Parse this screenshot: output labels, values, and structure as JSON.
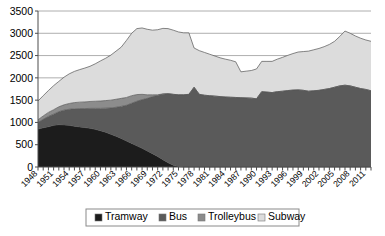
{
  "chart_data": {
    "type": "area",
    "stacked": true,
    "title": "",
    "xlabel": "",
    "ylabel": "",
    "ylim": [
      0,
      3500
    ],
    "yticks": [
      0,
      500,
      1000,
      1500,
      2000,
      2500,
      3000,
      3500
    ],
    "grid": true,
    "legend_position": "bottom",
    "x": [
      1948,
      1949,
      1950,
      1951,
      1952,
      1953,
      1954,
      1955,
      1956,
      1957,
      1958,
      1959,
      1960,
      1961,
      1962,
      1963,
      1964,
      1965,
      1966,
      1967,
      1968,
      1969,
      1970,
      1971,
      1972,
      1973,
      1974,
      1975,
      1976,
      1977,
      1978,
      1979,
      1980,
      1981,
      1982,
      1983,
      1984,
      1985,
      1986,
      1987,
      1988,
      1989,
      1990,
      1991,
      1992,
      1993,
      1994,
      1995,
      1996,
      1997,
      1998,
      1999,
      2000,
      2001,
      2002,
      2003,
      2004,
      2005,
      2006,
      2007,
      2008,
      2009,
      2010,
      2011,
      2012
    ],
    "xtick_labels": [
      1948,
      1951,
      1954,
      1957,
      1960,
      1963,
      1966,
      1969,
      1972,
      1975,
      1978,
      1981,
      1984,
      1987,
      1990,
      1993,
      1996,
      1999,
      2002,
      2005,
      2008,
      2011
    ],
    "xtick_step": 3,
    "series": [
      {
        "name": "Tramway",
        "color": "#1c1c1c",
        "values": [
          850,
          880,
          905,
          935,
          950,
          945,
          935,
          915,
          900,
          885,
          870,
          845,
          815,
          780,
          735,
          690,
          640,
          585,
          530,
          475,
          420,
          360,
          300,
          235,
          165,
          95,
          40,
          10,
          0,
          0,
          0,
          0,
          0,
          0,
          0,
          0,
          0,
          0,
          0,
          0,
          0,
          0,
          0,
          0,
          0,
          0,
          0,
          0,
          0,
          0,
          0,
          0,
          0,
          0,
          0,
          0,
          0,
          0,
          0,
          0,
          0,
          0,
          0,
          0,
          0
        ]
      },
      {
        "name": "Bus",
        "color": "#5a5a5a",
        "values": [
          150,
          190,
          230,
          250,
          290,
          330,
          360,
          390,
          410,
          425,
          445,
          470,
          500,
          540,
          590,
          650,
          720,
          800,
          900,
          1000,
          1090,
          1180,
          1280,
          1370,
          1470,
          1550,
          1590,
          1610,
          1620,
          1630,
          1790,
          1630,
          1610,
          1600,
          1590,
          1580,
          1570,
          1565,
          1560,
          1555,
          1550,
          1545,
          1530,
          1690,
          1680,
          1670,
          1690,
          1700,
          1715,
          1725,
          1730,
          1720,
          1700,
          1710,
          1720,
          1740,
          1760,
          1790,
          1820,
          1835,
          1820,
          1790,
          1760,
          1740,
          1710
        ]
      },
      {
        "name": "Trolleybus",
        "color": "#8c8c8c",
        "values": [
          60,
          75,
          90,
          100,
          110,
          120,
          130,
          140,
          145,
          150,
          155,
          160,
          165,
          170,
          175,
          180,
          180,
          175,
          170,
          150,
          120,
          80,
          40,
          15,
          5,
          0,
          0,
          0,
          0,
          0,
          0,
          0,
          0,
          0,
          0,
          0,
          0,
          0,
          0,
          0,
          0,
          0,
          0,
          0,
          0,
          0,
          0,
          0,
          0,
          0,
          0,
          0,
          0,
          0,
          0,
          0,
          0,
          0,
          0,
          0,
          0,
          0,
          0,
          0,
          0
        ]
      },
      {
        "name": "Subway",
        "color": "#dcdcdc",
        "values": [
          420,
          455,
          490,
          540,
          570,
          620,
          665,
          700,
          730,
          760,
          790,
          840,
          900,
          950,
          1010,
          1080,
          1150,
          1280,
          1400,
          1480,
          1490,
          1470,
          1450,
          1460,
          1470,
          1460,
          1440,
          1410,
          1390,
          1380,
          880,
          980,
          960,
          930,
          900,
          870,
          850,
          830,
          800,
          580,
          600,
          620,
          670,
          680,
          690,
          700,
          730,
          760,
          790,
          820,
          850,
          870,
          900,
          920,
          940,
          960,
          990,
          1030,
          1110,
          1215,
          1180,
          1150,
          1130,
          1110,
          1110
        ]
      }
    ]
  },
  "legend": {
    "items": [
      {
        "label": "Tramway",
        "color": "#1c1c1c"
      },
      {
        "label": "Bus",
        "color": "#5a5a5a"
      },
      {
        "label": "Trolleybus",
        "color": "#8c8c8c"
      },
      {
        "label": "Subway",
        "color": "#dcdcdc"
      }
    ]
  }
}
